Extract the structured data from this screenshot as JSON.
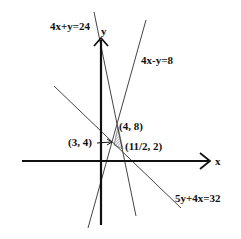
{
  "diagram": {
    "type": "linear-programming-feasible-region",
    "axes": {
      "x_label": "x",
      "y_label": "y"
    },
    "lines": [
      {
        "equation": "4x+y=24"
      },
      {
        "equation": "4x-y=8"
      },
      {
        "equation": "5y+4x=32"
      }
    ],
    "points": [
      {
        "label": "(4, 8)"
      },
      {
        "label": "(3, 4)"
      },
      {
        "label": "(11/2, 2)"
      }
    ],
    "colors": {
      "ink": "#111111",
      "thin_line": "#444444",
      "shade": "#999999"
    }
  }
}
